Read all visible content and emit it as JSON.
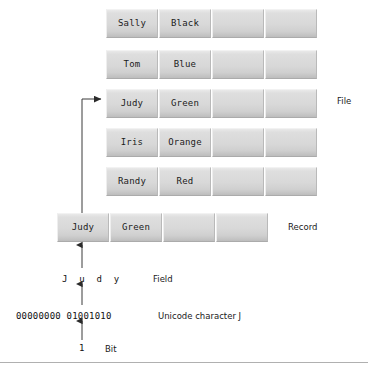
{
  "diagram": {
    "file": {
      "label": "File",
      "columns": 4,
      "rows": [
        {
          "cells": [
            "Sally",
            "Black",
            "",
            ""
          ]
        },
        {
          "cells": [
            "Tom",
            "Blue",
            "",
            ""
          ]
        },
        {
          "cells": [
            "Judy",
            "Green",
            "",
            ""
          ]
        },
        {
          "cells": [
            "Iris",
            "Orange",
            "",
            ""
          ]
        },
        {
          "cells": [
            "Randy",
            "Red",
            "",
            ""
          ]
        }
      ]
    },
    "record": {
      "label": "Record",
      "cells": [
        "Judy",
        "Green",
        "",
        ""
      ]
    },
    "field": {
      "label": "Field",
      "characters": "J u d y"
    },
    "character": {
      "label": "Unicode character J",
      "bits": "00000000 01001010"
    },
    "bit": {
      "label": "Bit",
      "value": "1"
    },
    "colors": {
      "cell_light": "#e9e9e9",
      "cell_dark": "#bdbdbd",
      "cell_border": "#ababab",
      "arrow": "#2b2b2b",
      "text": "#1a1a1a",
      "rule": "#b0b0b0"
    }
  }
}
